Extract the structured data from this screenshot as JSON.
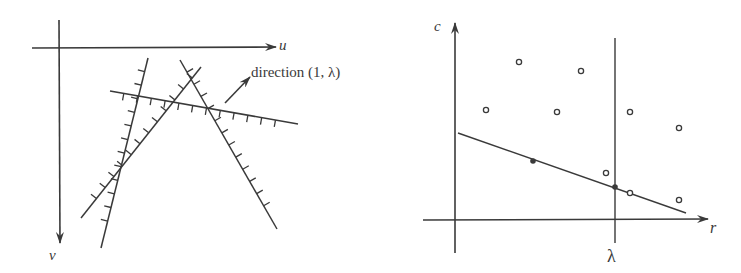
{
  "left_panel": {
    "axes": {
      "u_label": "u",
      "v_label": "v"
    },
    "direction_label": "direction (1, λ)",
    "constraint_lines": [
      {
        "name": "line-a",
        "from": [
          148,
          58
        ],
        "to": [
          101,
          248
        ],
        "hatch_side": "right"
      },
      {
        "name": "line-b",
        "from": [
          201,
          67
        ],
        "to": [
          81,
          218
        ],
        "hatch_side": "right"
      },
      {
        "name": "line-c",
        "from": [
          180,
          60
        ],
        "to": [
          277,
          229
        ],
        "hatch_side": "left"
      },
      {
        "name": "line-d",
        "from": [
          110,
          91
        ],
        "to": [
          298,
          124
        ],
        "hatch_side": "right"
      }
    ]
  },
  "right_panel": {
    "axes": {
      "c_label": "c",
      "r_label": "r"
    },
    "lambda_label": "λ",
    "open_points": [
      [
        486,
        110
      ],
      [
        519,
        62
      ],
      [
        557,
        112
      ],
      [
        581,
        71
      ],
      [
        630,
        112
      ],
      [
        679,
        128
      ],
      [
        606,
        173
      ],
      [
        630,
        193
      ],
      [
        679,
        200
      ]
    ],
    "filled_points": [
      [
        533,
        161
      ],
      [
        615,
        187
      ]
    ],
    "fitted_line": {
      "from": [
        458,
        133
      ],
      "to": [
        686,
        213
      ]
    }
  },
  "colors": {
    "ink": "#3a3a3a",
    "background": "#ffffff"
  }
}
